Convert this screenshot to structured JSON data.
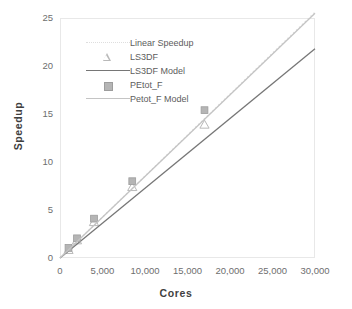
{
  "chart_data": {
    "type": "line",
    "title": "",
    "xlabel": "Cores",
    "ylabel": "Speedup",
    "xlim": [
      0,
      30000
    ],
    "ylim": [
      0,
      25
    ],
    "xticks": [
      0,
      5000,
      10000,
      15000,
      20000,
      25000,
      30000
    ],
    "xtick_labels": [
      "0",
      "5,000",
      "10,000",
      "15,000",
      "20,000",
      "25,000",
      "30,000"
    ],
    "yticks": [
      0,
      5,
      10,
      15,
      20,
      25
    ],
    "ytick_labels": [
      "0",
      "5",
      "10",
      "15",
      "20",
      "25"
    ],
    "grid": false,
    "legend_position": "upper-left-inside",
    "series": [
      {
        "name": "Linear Speedup",
        "style": "dotted-line",
        "color": "#dedede",
        "x": [
          0,
          30000
        ],
        "values": [
          0,
          25.6
        ]
      },
      {
        "name": "LS3DF",
        "style": "markers",
        "marker": "open-triangle",
        "color": "#b9b9b9",
        "x": [
          1000,
          2000,
          4000,
          8500,
          17000
        ],
        "values": [
          0.85,
          1.85,
          3.75,
          7.4,
          13.9
        ]
      },
      {
        "name": "LS3DF Model",
        "style": "solid-line",
        "color": "#767676",
        "x": [
          0,
          30000
        ],
        "values": [
          0,
          21.8
        ]
      },
      {
        "name": "PEtot_F",
        "style": "markers",
        "marker": "filled-square",
        "color": "#b5b5b5",
        "x": [
          1000,
          2000,
          4000,
          8500,
          17000
        ],
        "values": [
          1.05,
          2.05,
          4.1,
          8.0,
          15.4
        ]
      },
      {
        "name": "Petot_F Model",
        "style": "solid-line",
        "color": "#c4c4c4",
        "x": [
          0,
          30000
        ],
        "values": [
          0,
          25.5
        ]
      }
    ]
  },
  "axes": {
    "x_title": "Cores",
    "y_title": "Speedup"
  },
  "legend": {
    "items": [
      {
        "label": "Linear Speedup",
        "key": "dotted-line-key"
      },
      {
        "label": "LS3DF",
        "key": "open-triangle-key"
      },
      {
        "label": "LS3DF Model",
        "key": "solid-dark-line-key"
      },
      {
        "label": "PEtot_F",
        "key": "filled-square-key"
      },
      {
        "label": "Petot_F Model",
        "key": "solid-light-line-key"
      }
    ]
  },
  "colors": {
    "linear_speedup": "#dedede",
    "ls3df_marker": "#b9b9b9",
    "ls3df_model": "#767676",
    "petot_marker": "#b5b5b5",
    "petot_model": "#c4c4c4",
    "frame": "#e8e8e8",
    "tick_text": "#6e6e6e",
    "axis_title": "#3f3f3f"
  }
}
